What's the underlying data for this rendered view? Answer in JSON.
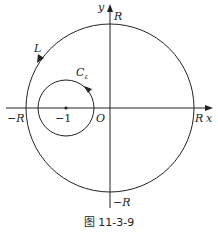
{
  "figure": {
    "caption": "图 11-3-9",
    "axes": {
      "x_label": "x",
      "y_label": "y",
      "origin_label": "O"
    },
    "contours": {
      "large": {
        "label": "L",
        "direction": "counterclockwise"
      },
      "small": {
        "label": "C",
        "subscript": "ε",
        "direction": "counterclockwise",
        "center_label": "−1"
      }
    },
    "tick_labels": {
      "top": "R",
      "bottom": "−R",
      "left": "−R",
      "right": "R"
    },
    "colors": {
      "stroke": "#222222",
      "background": "#ffffff"
    }
  }
}
